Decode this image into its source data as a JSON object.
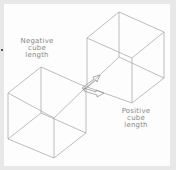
{
  "diagram": {
    "labels": {
      "negative": [
        "Negative",
        "cube",
        "length"
      ],
      "positive": [
        "Positive",
        "cube",
        "length"
      ]
    },
    "colors": {
      "background": "#fdfdfd",
      "frame": "#e8e8e8",
      "line": "#9a9a9a",
      "text": "#8a8a8a"
    },
    "shapes": [
      "wireframe-cube-negative",
      "wireframe-cube-positive",
      "arrow-upper-right",
      "arrow-right"
    ]
  }
}
